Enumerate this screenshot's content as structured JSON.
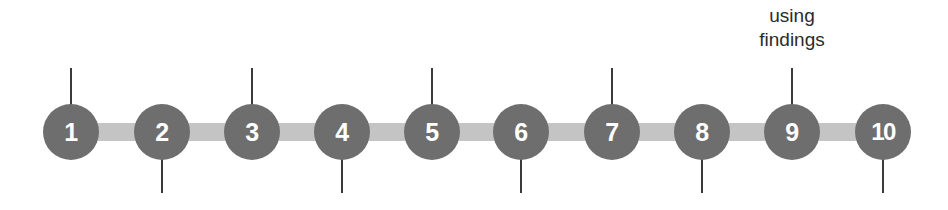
{
  "diagram": {
    "type": "numbered-step-timeline",
    "background_color": "#ffffff",
    "node_color": "#6e6e6e",
    "node_label_color": "#ffffff",
    "connector_color": "#c4c4c4",
    "tick_color": "#3a3a3a",
    "annotation_color": "#2b2b2b",
    "node_count": 10,
    "nodes": [
      {
        "label": "1",
        "cx": 71,
        "tick": "up"
      },
      {
        "label": "2",
        "cx": 162,
        "tick": "down"
      },
      {
        "label": "3",
        "cx": 252,
        "tick": "up"
      },
      {
        "label": "4",
        "cx": 342,
        "tick": "down"
      },
      {
        "label": "5",
        "cx": 432,
        "tick": "up"
      },
      {
        "label": "6",
        "cx": 521,
        "tick": "down"
      },
      {
        "label": "7",
        "cx": 612,
        "tick": "up"
      },
      {
        "label": "8",
        "cx": 702,
        "tick": "down"
      },
      {
        "label": "9",
        "cx": 792,
        "tick": "up"
      },
      {
        "label": "10",
        "cx": 883,
        "tick": "down"
      }
    ],
    "connector": {
      "x_start": 60,
      "x_end": 896
    },
    "annotations": [
      {
        "lines": [
          "using",
          "findings"
        ],
        "anchor_node": "9",
        "cx": 792,
        "top": 4
      }
    ]
  }
}
